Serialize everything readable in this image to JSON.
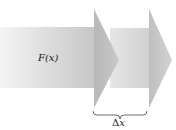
{
  "diagram": {
    "labels": {
      "force": "F(x)",
      "displacement_symbol": "Δ",
      "displacement_var": "x"
    },
    "colors": {
      "shaft1_start": "#f2f2f2",
      "shaft1_end": "#c4c4c4",
      "head1": "#bcbcbc",
      "shaft2_start": "#e2e2e2",
      "shaft2_end": "#cfcfcf",
      "head2": "#c2c2c2",
      "brace": "#333333"
    },
    "elements": [
      "arrow-1 (F(x))",
      "arrow-2 (shifted by Δx)",
      "brace spanning Δx"
    ]
  }
}
